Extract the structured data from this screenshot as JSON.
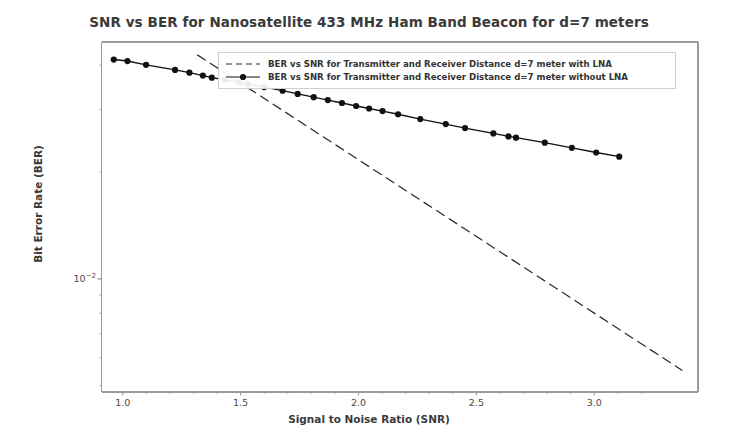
{
  "chart_data": {
    "type": "line",
    "title": "SNR vs BER for Nanosatellite 433 MHz Ham Band Beacon for d=7 meters",
    "xlabel": "Signal to Noise Ratio (SNR)",
    "ylabel": "Bit Error Rate (BER)",
    "yscale": "log",
    "xscale": "linear",
    "grid": false,
    "legend_position": "upper center",
    "xlim": [
      0.91,
      3.44
    ],
    "ylim": [
      0.0048,
      0.0465
    ],
    "xticks": [
      "1.0",
      "1.5",
      "2.0",
      "2.5",
      "3.0"
    ],
    "xtick_values": [
      1.0,
      1.5,
      2.0,
      2.5,
      3.0
    ],
    "yticks": [
      "10⁻²"
    ],
    "ytick_values": [
      0.01
    ],
    "series": [
      {
        "name": "BER vs SNR for Transmitter and Receiver Distance d=7 meter with LNA",
        "style": "dashed",
        "color": "#2b2b2b",
        "marker": "none",
        "x": [
          1.318,
          3.372
        ],
        "y": [
          0.0427,
          0.00553
        ]
      },
      {
        "name": "BER vs SNR for Transmitter and Receiver Distance d=7 meter without LNA",
        "style": "solid",
        "color": "#111111",
        "marker": "circle",
        "x": [
          0.962,
          1.02,
          1.099,
          1.222,
          1.283,
          1.34,
          1.378,
          1.432,
          1.495,
          1.53,
          1.6,
          1.678,
          1.742,
          1.81,
          1.87,
          1.93,
          1.99,
          2.045,
          2.102,
          2.168,
          2.262,
          2.37,
          2.452,
          2.572,
          2.636,
          2.668,
          2.79,
          2.905,
          3.008,
          3.106
        ],
        "y": [
          0.0415,
          0.0411,
          0.0401,
          0.0388,
          0.0381,
          0.0374,
          0.0369,
          0.0364,
          0.0357,
          0.0354,
          0.0347,
          0.0339,
          0.0332,
          0.0325,
          0.0319,
          0.0313,
          0.0307,
          0.0302,
          0.0297,
          0.0291,
          0.0282,
          0.0273,
          0.0266,
          0.0257,
          0.0252,
          0.025,
          0.0242,
          0.0234,
          0.0227,
          0.0221
        ]
      }
    ]
  },
  "figure": {
    "background_color": "#ffffff",
    "title_color": "#3a3a3a",
    "axis_color": "#9a9a9a"
  }
}
